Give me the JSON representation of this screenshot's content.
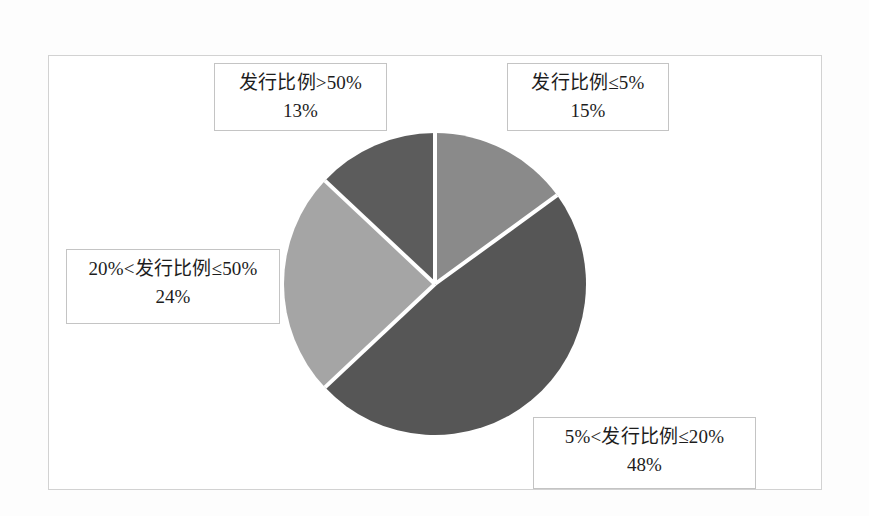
{
  "chart_data": {
    "type": "pie",
    "title": "",
    "categories": [
      "发行比例≤5%",
      "5%<发行比例≤20%",
      "20%<发行比例≤50%",
      "发行比例>50%"
    ],
    "values": [
      15,
      24,
      48,
      13
    ],
    "value_labels": [
      "15%",
      "48%",
      "24%",
      "13%"
    ],
    "unit": "%",
    "legend": "none",
    "grid": false,
    "slices": [
      {
        "label": "发行比例≤5%",
        "value": 15,
        "value_label": "15%",
        "color": "#8a8a8a",
        "start_angle_deg": 0,
        "sweep_deg": 54
      },
      {
        "label": "5%<发行比例≤20%",
        "value": 48,
        "value_label": "48%",
        "color": "#565656",
        "start_angle_deg": 54,
        "sweep_deg": 172.8
      },
      {
        "label": "20%<发行比例≤50%",
        "value": 24,
        "value_label": "24%",
        "color": "#a5a5a5",
        "start_angle_deg": 226.8,
        "sweep_deg": 86.4
      },
      {
        "label": "发行比例>50%",
        "value": 13,
        "value_label": "13%",
        "color": "#5c5c5c",
        "start_angle_deg": 313.2,
        "sweep_deg": 46.8
      }
    ],
    "separator_color": "#ffffff",
    "frame_color": "#d2d2d2",
    "background_color": "#ffffff"
  },
  "labels": {
    "gt50": {
      "title": "发行比例>50%",
      "value": "13%"
    },
    "le5": {
      "title": "发行比例≤5%",
      "value": "15%"
    },
    "pct20to50": {
      "title": "20%<发行比例≤50%",
      "value": "24%"
    },
    "pct5to20": {
      "title": "5%<发行比例≤20%",
      "value": "48%"
    }
  }
}
